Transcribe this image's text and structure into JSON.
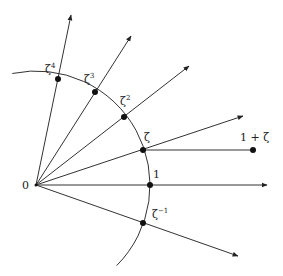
{
  "diagram": {
    "origin": {
      "label": "0",
      "x": 36,
      "y": 185
    },
    "arc": {
      "cx": 36,
      "cy": 185,
      "r": 114
    },
    "points": [
      {
        "id": "zeta4",
        "base": "ζ",
        "exp": "4",
        "x": 58,
        "y": 79,
        "ray_end": [
          71,
          15
        ],
        "lx": 45,
        "ly": 73
      },
      {
        "id": "zeta3",
        "base": "ζ",
        "exp": "3",
        "x": 95,
        "y": 92,
        "ray_end": [
          131,
          36
        ],
        "lx": 84,
        "ly": 83
      },
      {
        "id": "zeta2",
        "base": "ζ",
        "exp": "2",
        "x": 124,
        "y": 117,
        "ray_end": [
          189,
          66
        ],
        "lx": 120,
        "ly": 105
      },
      {
        "id": "zeta",
        "base": "ζ",
        "exp": "",
        "x": 143,
        "y": 150,
        "ray_end": [
          243,
          116
        ],
        "lx": 144,
        "ly": 141
      },
      {
        "id": "one",
        "base": "1",
        "exp": "",
        "x": 150,
        "y": 185,
        "ray_end": [
          267,
          185
        ],
        "lx": 153,
        "ly": 178
      },
      {
        "id": "zeta-inv",
        "base": "ζ",
        "exp": "−1",
        "x": 143,
        "y": 223,
        "ray_end": [
          238,
          256
        ],
        "lx": 152,
        "ly": 218
      }
    ],
    "sum_point": {
      "label": "1 + ζ",
      "x": 253,
      "y": 150,
      "from": [
        143,
        150
      ],
      "lx": 240,
      "ly": 141
    }
  }
}
